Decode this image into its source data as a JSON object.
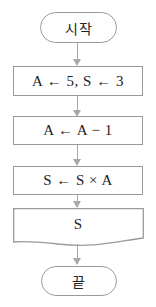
{
  "flowchart": {
    "start_label": "시작",
    "end_label": "끝",
    "steps": [
      {
        "type": "process",
        "text": "A ← 5, S ← 3"
      },
      {
        "type": "process",
        "text": "A ← A − 1"
      },
      {
        "type": "process",
        "text": "S ← S × A"
      },
      {
        "type": "output",
        "text": "S"
      }
    ],
    "colors": {
      "border": "#9a9a9a",
      "arrow": "#a8a8a8",
      "text": "#222222"
    }
  }
}
